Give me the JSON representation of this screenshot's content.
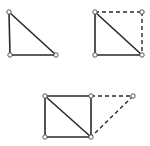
{
  "diagram": {
    "colors": {
      "edge": "#2a2a2a",
      "vertex_fill": "#ffffff",
      "vertex_stroke": "#444444",
      "background": "#ffffff"
    },
    "figures": [
      {
        "name": "right-triangle",
        "vertices": [
          [
            9,
            12
          ],
          [
            10,
            55
          ],
          [
            56,
            55
          ]
        ],
        "solid_edges": [
          [
            0,
            1
          ],
          [
            1,
            2
          ],
          [
            0,
            2
          ]
        ],
        "dashed_edges": []
      },
      {
        "name": "triangle-completed-to-square",
        "vertices": [
          [
            95,
            12
          ],
          [
            95,
            55
          ],
          [
            142,
            55
          ],
          [
            142,
            12
          ]
        ],
        "solid_edges": [
          [
            0,
            1
          ],
          [
            1,
            2
          ],
          [
            0,
            2
          ]
        ],
        "dashed_edges": [
          [
            0,
            3
          ],
          [
            3,
            2
          ]
        ]
      },
      {
        "name": "square-with-extension-triangle",
        "vertices": [
          [
            45,
            96
          ],
          [
            45,
            137
          ],
          [
            91,
            137
          ],
          [
            91,
            96
          ],
          [
            133,
            96
          ]
        ],
        "solid_edges": [
          [
            0,
            1
          ],
          [
            1,
            2
          ],
          [
            2,
            3
          ],
          [
            3,
            0
          ],
          [
            0,
            2
          ]
        ],
        "dashed_edges": [
          [
            3,
            4
          ],
          [
            4,
            2
          ]
        ]
      }
    ]
  }
}
